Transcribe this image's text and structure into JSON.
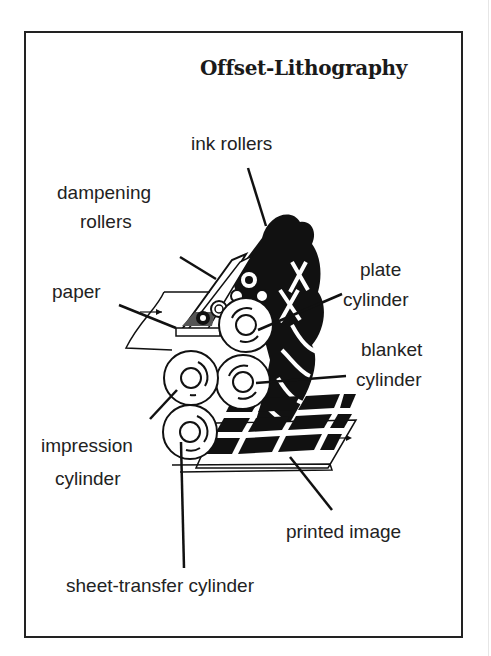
{
  "title": "Offset-Lithography",
  "labels": {
    "ink_rollers": "ink rollers",
    "dampening_1": "dampening",
    "dampening_2": "rollers",
    "paper": "paper",
    "plate_1": "plate",
    "plate_2": "cylinder",
    "blanket_1": "blanket",
    "blanket_2": "cylinder",
    "impression_1": "impression",
    "impression_2": "cylinder",
    "printed_image": "printed image",
    "sheet_transfer": "sheet-transfer cylinder"
  },
  "colors": {
    "ink": "#111111",
    "paper": "#ffffff",
    "frame": "#222222"
  }
}
